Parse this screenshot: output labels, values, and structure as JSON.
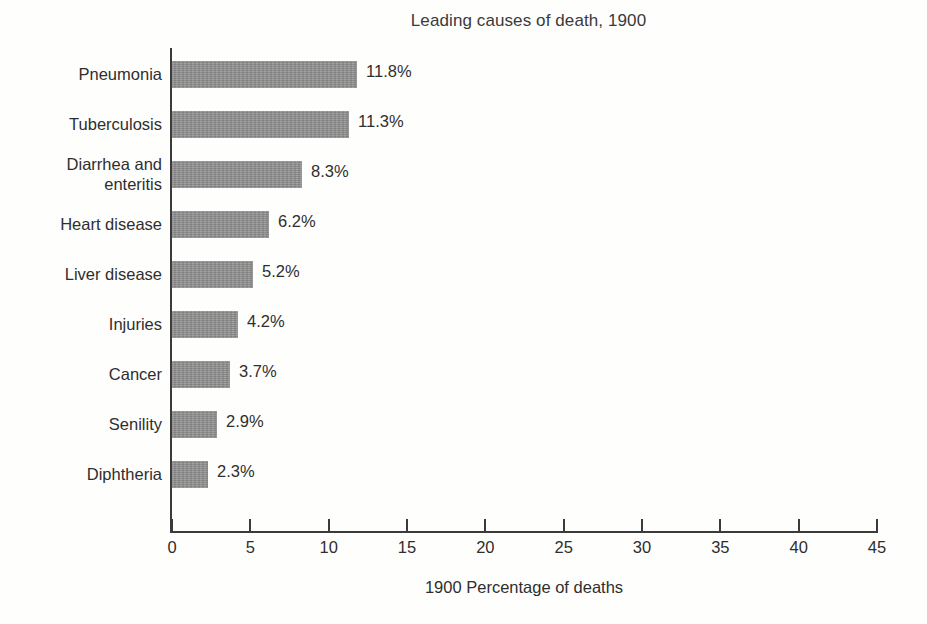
{
  "chart_data": {
    "type": "bar",
    "orientation": "horizontal",
    "title": "Leading causes of death, 1900",
    "xlabel": "1900 Percentage of deaths",
    "ylabel": "",
    "xlim": [
      0,
      45
    ],
    "xticks": [
      0,
      5,
      10,
      15,
      20,
      25,
      30,
      35,
      40,
      45
    ],
    "grid": false,
    "legend": null,
    "bar_color": "#8d8d8d",
    "axis_color": "#3b3b3b",
    "categories": [
      "Pneumonia",
      "Tuberculosis",
      "Diarrhea and enteritis",
      "Heart disease",
      "Liver disease",
      "Injuries",
      "Cancer",
      "Senility",
      "Diphtheria"
    ],
    "values": [
      11.8,
      11.3,
      8.3,
      6.2,
      5.2,
      4.2,
      3.7,
      2.9,
      2.3
    ],
    "value_labels": [
      "11.8%",
      "11.3%",
      "8.3%",
      "6.2%",
      "5.2%",
      "4.2%",
      "3.7%",
      "2.9%",
      "2.3%"
    ],
    "bars": [
      {
        "category": "Pneumonia",
        "label_lines": [
          "Pneumonia"
        ],
        "value": 11.8,
        "value_label": "11.8%"
      },
      {
        "category": "Tuberculosis",
        "label_lines": [
          "Tuberculosis"
        ],
        "value": 11.3,
        "value_label": "11.3%"
      },
      {
        "category": "Diarrhea and enteritis",
        "label_lines": [
          "Diarrhea and",
          "enteritis"
        ],
        "value": 8.3,
        "value_label": "8.3%"
      },
      {
        "category": "Heart disease",
        "label_lines": [
          "Heart disease"
        ],
        "value": 6.2,
        "value_label": "6.2%"
      },
      {
        "category": "Liver disease",
        "label_lines": [
          "Liver disease"
        ],
        "value": 5.2,
        "value_label": "5.2%"
      },
      {
        "category": "Injuries",
        "label_lines": [
          "Injuries"
        ],
        "value": 4.2,
        "value_label": "4.2%"
      },
      {
        "category": "Cancer",
        "label_lines": [
          "Cancer"
        ],
        "value": 3.7,
        "value_label": "3.7%"
      },
      {
        "category": "Senility",
        "label_lines": [
          "Senility"
        ],
        "value": 2.9,
        "value_label": "2.9%"
      },
      {
        "category": "Diphtheria",
        "label_lines": [
          "Diphtheria"
        ],
        "value": 2.3,
        "value_label": "2.3%"
      }
    ]
  }
}
